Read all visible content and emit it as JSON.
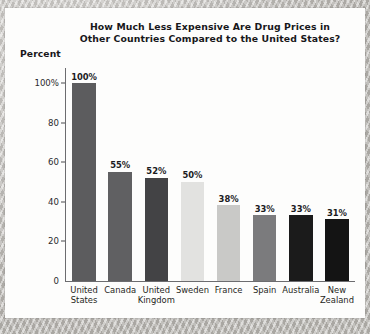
{
  "chart_data": {
    "type": "bar",
    "title": "How Much Less Expensive Are Drug Prices in Other Countries Compared to the United States?",
    "title_line1": "How Much Less Expensive Are Drug Prices in",
    "title_line2": "Other Countries Compared to the United States?",
    "xlabel": "",
    "ylabel": "Percent",
    "ylim": [
      0,
      100
    ],
    "grid": false,
    "legend": "none",
    "categories": [
      "United States",
      "Canada",
      "United Kingdom",
      "Sweden",
      "France",
      "Spain",
      "Australia",
      "New Zealand"
    ],
    "category_lines": [
      [
        "United",
        "States"
      ],
      [
        "Canada",
        ""
      ],
      [
        "United",
        "Kingdom"
      ],
      [
        "Sweden",
        ""
      ],
      [
        "France",
        ""
      ],
      [
        "Spain",
        ""
      ],
      [
        "Australia",
        ""
      ],
      [
        "New",
        "Zealand"
      ]
    ],
    "values": [
      100,
      55,
      52,
      50,
      38,
      33,
      33,
      31
    ],
    "value_labels": [
      "100%",
      "55%",
      "52%",
      "50%",
      "38%",
      "33%",
      "33%",
      "31%"
    ],
    "bar_colors": [
      "#5c5c5e",
      "#606062",
      "#434345",
      "#e2e2e0",
      "#c9c9c7",
      "#7b7b7d",
      "#1b1b1b",
      "#141414"
    ],
    "yticks": [
      0,
      20,
      40,
      60,
      80,
      100
    ],
    "ytick_labels": [
      "0",
      "20",
      "40",
      "60",
      "80",
      "100%"
    ]
  },
  "figure": {
    "background_color": "#c6c3be",
    "card_color": "#fdfdfc",
    "axis_color": "#6c6c6f",
    "text_color": "#17171a"
  }
}
